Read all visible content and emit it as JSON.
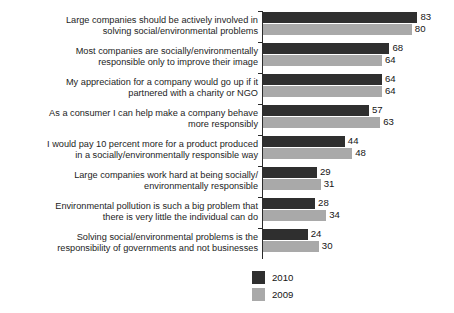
{
  "chart_data": {
    "type": "bar",
    "orientation": "horizontal",
    "title": "",
    "subtitle": "",
    "xlabel": "",
    "ylabel": "",
    "xlim": [
      0,
      100
    ],
    "grid": false,
    "legend_position": "bottom-center",
    "categories": [
      "Large companies should be actively involved in\nsolving social/environmental problems",
      "Most companies are socially/environmentally\nresponsible only to improve their image",
      "My appreciation for a company would go up if it\npartnered with a charity or NGO",
      "As a consumer I can help make a company behave\nmore responsibly",
      "I would pay 10 percent more for a product produced\nin a socially/environmentally responsible way",
      "Large companies work hard at being socially/\nenvironmentally responsible",
      "Environmental pollution is such a big problem that\nthere is very little the individual can do",
      "Solving social/environmental problems is the\nresponsibility of governments and not businesses"
    ],
    "series": [
      {
        "name": "2010",
        "color": "#2f2f2f",
        "values": [
          83,
          68,
          64,
          57,
          44,
          29,
          28,
          24
        ]
      },
      {
        "name": "2009",
        "color": "#a9a9a9",
        "values": [
          80,
          64,
          64,
          63,
          48,
          31,
          34,
          30
        ]
      }
    ]
  },
  "legend": {
    "items": [
      {
        "label": "2010",
        "color": "#2f2f2f"
      },
      {
        "label": "2009",
        "color": "#a9a9a9"
      }
    ]
  },
  "axis": {
    "color": "#2b2b2b"
  }
}
